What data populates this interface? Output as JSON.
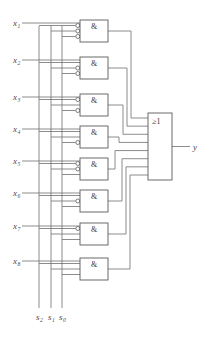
{
  "diagram": {
    "wire_color": "#6e6e6e",
    "box_color": "#5a5a5a",
    "text_color": "#4a4a4a"
  },
  "inputs": [
    {
      "name": "x1",
      "base": "x",
      "sub": "1"
    },
    {
      "name": "x2",
      "base": "x",
      "sub": "2"
    },
    {
      "name": "x3",
      "base": "x",
      "sub": "3"
    },
    {
      "name": "x4",
      "base": "x",
      "sub": "4"
    },
    {
      "name": "x5",
      "base": "x",
      "sub": "5"
    },
    {
      "name": "x6",
      "base": "x",
      "sub": "6"
    },
    {
      "name": "x7",
      "base": "x",
      "sub": "7"
    },
    {
      "name": "x8",
      "base": "x",
      "sub": "8"
    }
  ],
  "selects": [
    {
      "name": "s2",
      "base": "s",
      "sub": "2"
    },
    {
      "name": "s1",
      "base": "s",
      "sub": "1"
    },
    {
      "name": "s0",
      "base": "s",
      "sub": "0"
    }
  ],
  "and_gates": [
    {
      "label": "&",
      "inverted": [
        true,
        true,
        true
      ]
    },
    {
      "label": "&",
      "inverted": [
        false,
        true,
        true
      ]
    },
    {
      "label": "&",
      "inverted": [
        true,
        false,
        true
      ]
    },
    {
      "label": "&",
      "inverted": [
        false,
        false,
        true
      ]
    },
    {
      "label": "&",
      "inverted": [
        true,
        true,
        false
      ]
    },
    {
      "label": "&",
      "inverted": [
        false,
        true,
        false
      ]
    },
    {
      "label": "&",
      "inverted": [
        true,
        false,
        false
      ]
    },
    {
      "label": "&",
      "inverted": [
        false,
        false,
        false
      ]
    }
  ],
  "or_gate": {
    "label": "≥1"
  },
  "output": {
    "base": "y",
    "sub": ""
  }
}
